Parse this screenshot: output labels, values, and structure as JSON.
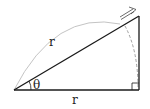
{
  "diagram": {
    "type": "geometry",
    "labels": {
      "hypotenuse": "r",
      "base": "r",
      "angle": "θ"
    },
    "colors": {
      "lines": "#1a1a1a",
      "arc": "#bdbdbd",
      "dashed_arc": "#8a8a8a"
    }
  }
}
